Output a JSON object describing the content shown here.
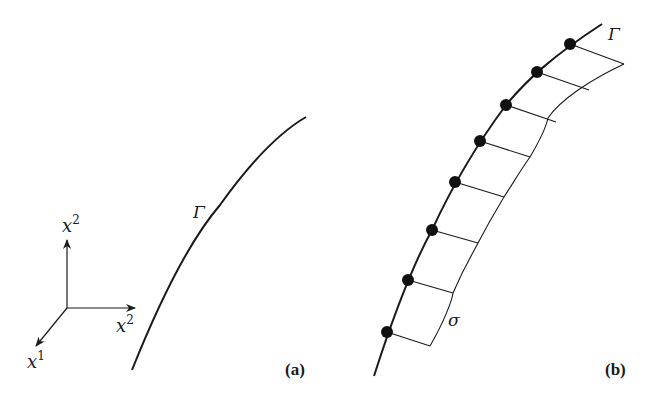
{
  "panel_a": {
    "label": "(a)",
    "curve_label": "Γ",
    "axes": {
      "x1_label": "x",
      "x1_sup": "1",
      "x2_label": "x",
      "x2_sup": "2",
      "x3_label": "x",
      "x3_sup": "2"
    }
  },
  "panel_b": {
    "label": "(b)",
    "curve_label": "Γ",
    "strip_label": "σ",
    "node_count": 8
  }
}
